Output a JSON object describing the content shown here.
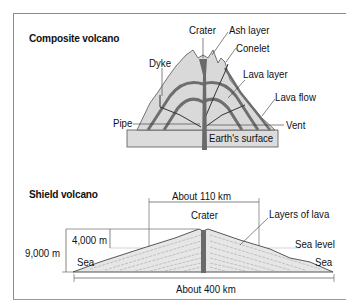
{
  "composite": {
    "title": "Composite volcano",
    "labels": {
      "crater": "Crater",
      "ash_layer": "Ash layer",
      "conelet": "Conelet",
      "dyke": "Dyke",
      "lava_layer": "Lava layer",
      "lava_flow": "Lava flow",
      "pipe": "Pipe",
      "vent": "Vent",
      "earth_surface": "Earth's surface"
    }
  },
  "shield": {
    "title": "Shield volcano",
    "labels": {
      "width_top": "About 110 km",
      "crater": "Crater",
      "layers_of_lava": "Layers of lava",
      "height_above_sea": "4,000 m",
      "height_total": "9,000 m",
      "sea_level": "Sea level",
      "sea_left": "Sea",
      "sea_right": "Sea",
      "width_base": "About 400 km"
    }
  },
  "colors": {
    "volcano_fill": "#d9d9d9",
    "lava_band": "#6e6e6e",
    "pipe": "#6a6a6a",
    "ground": "#dcdcdc",
    "line": "#333333"
  }
}
